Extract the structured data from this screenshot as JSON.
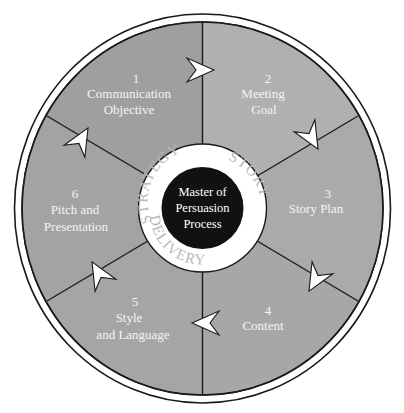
{
  "diagram": {
    "hub": {
      "lines": [
        "Master of",
        "Persuasion",
        "Process"
      ]
    },
    "ring_labels": {
      "strategy": "STRATEGY",
      "story": "STORY",
      "delivery": "DELIVERY"
    },
    "sectors": [
      {
        "number": "1",
        "lines": [
          "Communication",
          "Objective"
        ]
      },
      {
        "number": "2",
        "lines": [
          "Meeting",
          "Goal"
        ]
      },
      {
        "number": "3",
        "lines": [
          "Story Plan"
        ]
      },
      {
        "number": "4",
        "lines": [
          "Content"
        ]
      },
      {
        "number": "5",
        "lines": [
          "Style",
          "and Language"
        ]
      },
      {
        "number": "6",
        "lines": [
          "Pitch and",
          "Presentation"
        ]
      }
    ],
    "colors": {
      "sector_1": "#9f9f9f",
      "sector_2": "#b0b0b0",
      "sector_3": "#a9a9a9",
      "sector_4": "#a7a7a7",
      "sector_5": "#a5a5a5",
      "sector_6": "#a3a3a3",
      "hub_black": "#111111",
      "hub_ring": "#ffffff",
      "line": "#1a1a1a"
    },
    "flow_direction": "clockwise"
  }
}
